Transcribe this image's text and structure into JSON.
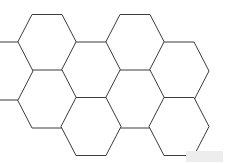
{
  "canvas": {
    "width": 225,
    "height": 164,
    "background_color": "#ffffff"
  },
  "diagram": {
    "name": "honeycomb-hexagon-grid",
    "title": "",
    "stroke_color": "#3c3c3c",
    "fill_color": "#ffffff",
    "stroke_width": 1,
    "hex_count": 9,
    "hex_width": 60,
    "hex_height": 58,
    "orientation": "flat-top",
    "cells": [
      {
        "id": "hex-r1-c1",
        "label": "",
        "cx": 47,
        "cy": 43.5,
        "column": 1,
        "row": 1
      },
      {
        "id": "hex-r1-c3",
        "label": "",
        "cx": 135,
        "cy": 43.5,
        "column": 3,
        "row": 1
      },
      {
        "id": "hex-r2-c2",
        "label": "",
        "cx": 91,
        "cy": 71.0,
        "column": 2,
        "row": 2
      },
      {
        "id": "hex-r2-c4",
        "label": "",
        "cx": 179,
        "cy": 71.0,
        "column": 4,
        "row": 2
      },
      {
        "id": "hex-r3-c1",
        "label": "",
        "cx": 47,
        "cy": 99.0,
        "column": 1,
        "row": 3
      },
      {
        "id": "hex-r3-c3",
        "label": "",
        "cx": 135,
        "cy": 99.0,
        "column": 3,
        "row": 3
      },
      {
        "id": "hex-r4-c2",
        "label": "",
        "cx": 91,
        "cy": 126.5,
        "column": 2,
        "row": 4
      },
      {
        "id": "hex-r4-c4",
        "label": "",
        "cx": 179,
        "cy": 126.5,
        "column": 4,
        "row": 4
      },
      {
        "id": "hex-r2-c0",
        "label": "",
        "cx": 3,
        "cy": 71.0,
        "column": 0,
        "row": 2
      }
    ]
  },
  "watermark": {
    "label": "",
    "color": "#ededed",
    "x": 186,
    "y": 151,
    "width": 37,
    "height": 11
  }
}
